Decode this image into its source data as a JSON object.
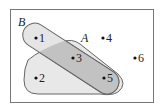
{
  "diagram": {
    "type": "venn",
    "universe": {
      "label": ""
    },
    "sets": [
      {
        "name": "A",
        "label": "A",
        "elements": [
          "2",
          "3",
          "5"
        ]
      },
      {
        "name": "B",
        "label": "B",
        "elements": [
          "1",
          "3",
          "5"
        ]
      }
    ],
    "points": [
      {
        "label": "1",
        "x": 36,
        "y": 38
      },
      {
        "label": "2",
        "x": 36,
        "y": 78
      },
      {
        "label": "3",
        "x": 73,
        "y": 58
      },
      {
        "label": "4",
        "x": 103,
        "y": 38
      },
      {
        "label": "5",
        "x": 104,
        "y": 78
      },
      {
        "label": "6",
        "x": 135,
        "y": 58
      }
    ],
    "colors": {
      "border": "#777777",
      "fill_light": "#e6e6e6",
      "fill_overlap": "#c4c4c4",
      "stroke": "#555555"
    }
  }
}
